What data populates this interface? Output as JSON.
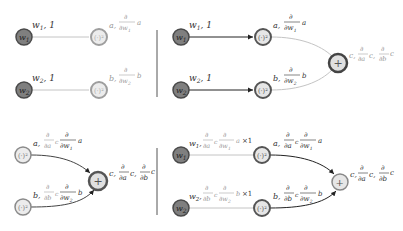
{
  "colors": {
    "input_node_fill": "#7f7f7f",
    "input_node_ring": "#4a4a4a",
    "op_node_fill": "#e6e6e6",
    "op_node_ring_dim": "#9e9e9e",
    "op_node_ring_dark": "#555555",
    "edge_dim": "#c4c4c4",
    "edge_dark": "#222222",
    "divider": "#555555"
  },
  "node_labels": {
    "w1": "w",
    "w1_sub": "1",
    "w2": "w",
    "w2_sub": "2",
    "square": "(·)²",
    "plus": "+"
  },
  "panels": [
    {
      "id": "forward-inputs",
      "labels": {
        "w1_out": "w₁, 1",
        "w2_out": "w₂, 1",
        "a_out": "a, ∂/∂w₁ a",
        "b_out": "b, ∂/∂w₂ b"
      }
    },
    {
      "id": "forward-sum",
      "labels": {
        "w1_out": "w₁, 1",
        "w2_out": "w₂, 1",
        "a_out": "a, ∂/∂w₁ a",
        "b_out": "b, ∂/∂w₂ b",
        "c_out": "c, ∂/∂a c, ∂/∂b c"
      }
    },
    {
      "id": "backward-sum",
      "labels": {
        "a_out": "a, ∂/∂a c ∂/∂w₁ a",
        "b_out": "b, ∂/∂b c ∂/∂w₂ b",
        "c_out": "c, ∂/∂a c, ∂/∂b c"
      }
    },
    {
      "id": "backward-inputs",
      "labels": {
        "w1_out": "w₁, ∂/∂a c ∂/∂w₁ a × 1",
        "w2_out": "w₂, ∂/∂b c ∂/∂w₂ b × 1",
        "a_out": "a, ∂/∂a c ∂/∂w₁ a",
        "b_out": "b, ∂/∂b c ∂/∂w₂ b",
        "c_out": "c, ∂/∂a c, ∂/∂b c"
      }
    }
  ],
  "text": {
    "partial": "∂",
    "w": "w",
    "one": "1",
    "two": "2",
    "a": "a",
    "b": "b",
    "c": "c",
    "comma": ",",
    "times_one": "×1",
    "w1_comma_1": ", 1"
  }
}
